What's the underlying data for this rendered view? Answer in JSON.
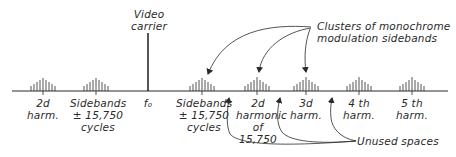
{
  "title_labels": {
    "video_carrier": "Video\ncarrier",
    "clusters_note": "Clusters of monochrome\nmodulation sidebands",
    "unused_note": "Unused spaces"
  },
  "axis_labels": {
    "harm2_left": "2d\nharm.",
    "sidebands_left": "Sidebands\n± 15,750\ncycles",
    "f0": "f₀",
    "sidebands_right": "Sidebands\n± 15,750\ncycles",
    "harmonic2_right": "2d\nharmonic\nof\n15,750",
    "harm3": "3d\nharm.",
    "harm4": "4 th\nharm.",
    "harm5": "5 th\nharm."
  },
  "colors": {
    "ink": "#2a2a2a",
    "background": "#ffffff"
  }
}
